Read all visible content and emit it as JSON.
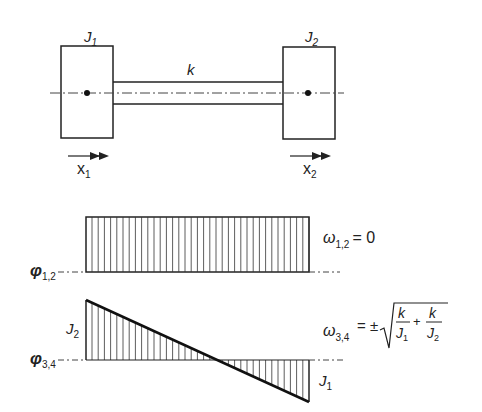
{
  "diagram": {
    "model": {
      "mass_left_label": "J",
      "mass_left_sub": "1",
      "mass_right_label": "J",
      "mass_right_sub": "2",
      "spring_label": "k",
      "coord_left": "x",
      "coord_left_sub": "1",
      "coord_right": "x",
      "coord_right_sub": "2"
    },
    "mode_rigid": {
      "phi_label": "φ",
      "phi_sub": "1,2",
      "omega_label": "ω",
      "omega_sub": "1,2",
      "omega_value": "= 0"
    },
    "mode_elastic": {
      "phi_label": "φ",
      "phi_sub": "3,4",
      "left_amp_label": "J",
      "left_amp_sub": "2",
      "right_amp_label": "J",
      "right_amp_sub": "1",
      "omega_label": "ω",
      "omega_sub": "3,4",
      "omega_eq": "= ±",
      "frac1_num": "k",
      "frac1_den": "J",
      "frac1_den_sub": "1",
      "plus": "+",
      "frac2_num": "k",
      "frac2_den": "J",
      "frac2_den_sub": "2"
    },
    "colors": {
      "ink": "#222222",
      "centerline": "#444444"
    }
  }
}
